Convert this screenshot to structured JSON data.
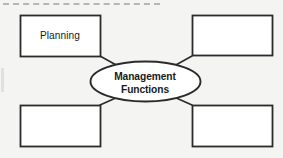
{
  "diagram": {
    "type": "concept-map",
    "background_color": "#f4f4f2",
    "stroke_color": "#2b2b2b",
    "fill_color": "#ffffff",
    "top_rule": {
      "name": "dashed-rule",
      "style": "dashed",
      "color": "#b6b6b4"
    },
    "center": {
      "shape": "ellipse",
      "line_1": "Management",
      "line_2": "Functions",
      "text": "Management Functions"
    },
    "boxes": [
      {
        "id": "top-left",
        "label": "Planning",
        "filled": true
      },
      {
        "id": "top-right",
        "label": "",
        "filled": false
      },
      {
        "id": "bottom-left",
        "label": "",
        "filled": false
      },
      {
        "id": "bottom-right",
        "label": "",
        "filled": false
      }
    ],
    "connectors": [
      {
        "id": "connector-top-left",
        "from": "top-left",
        "to": "center"
      },
      {
        "id": "connector-top-right",
        "from": "top-right",
        "to": "center"
      },
      {
        "id": "connector-bottom-left",
        "from": "bottom-left",
        "to": "center"
      },
      {
        "id": "connector-bottom-right",
        "from": "bottom-right",
        "to": "center"
      }
    ]
  }
}
